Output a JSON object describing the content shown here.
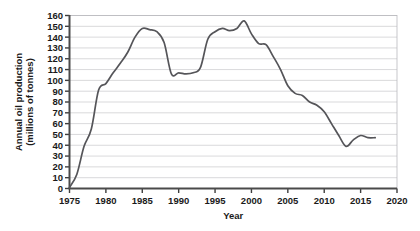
{
  "chart_data": {
    "type": "line",
    "title": "",
    "xlabel": "Year",
    "ylabel": "Annual oil production (millions of tonnes)",
    "ylabel_line1": "Annual oil production",
    "ylabel_line2": "(millions of tonnes)",
    "xlim": [
      1975,
      2020
    ],
    "ylim": [
      0,
      160
    ],
    "xticks": [
      1975,
      1980,
      1985,
      1990,
      1995,
      2000,
      2005,
      2010,
      2015,
      2020
    ],
    "yticks": [
      0,
      10,
      20,
      30,
      40,
      50,
      60,
      70,
      80,
      90,
      100,
      110,
      120,
      130,
      140,
      150,
      160
    ],
    "xtick_labels": [
      "1975",
      "1980",
      "1985",
      "1990",
      "1995",
      "2000",
      "2005",
      "2010",
      "2015",
      "2020"
    ],
    "ytick_labels": [
      "0",
      "10",
      "20",
      "30",
      "40",
      "50",
      "60",
      "70",
      "80",
      "90",
      "100",
      "110",
      "120",
      "130",
      "140",
      "150",
      "160"
    ],
    "grid": true,
    "grid_axis": "y",
    "legend": false,
    "legend_position": "none",
    "line_color": "#555559",
    "series": [
      {
        "name": "Annual oil production",
        "x": [
          1975,
          1976,
          1977,
          1978,
          1979,
          1980,
          1981,
          1982,
          1983,
          1984,
          1985,
          1986,
          1987,
          1988,
          1989,
          1990,
          1991,
          1992,
          1993,
          1994,
          1995,
          1996,
          1997,
          1998,
          1999,
          2000,
          2001,
          2002,
          2003,
          2004,
          2005,
          2006,
          2007,
          2008,
          2009,
          2010,
          2011,
          2012,
          2013,
          2014,
          2015,
          2016,
          2017
        ],
        "values": [
          1,
          13,
          39,
          55,
          91,
          97,
          107,
          116,
          126,
          140,
          148,
          147,
          145,
          135,
          106,
          107,
          106,
          107,
          112,
          138,
          145,
          148,
          146,
          148,
          155,
          143,
          134,
          133,
          122,
          110,
          95,
          88,
          86,
          80,
          77,
          71,
          60,
          49,
          39,
          45,
          49,
          47,
          47
        ]
      }
    ]
  }
}
